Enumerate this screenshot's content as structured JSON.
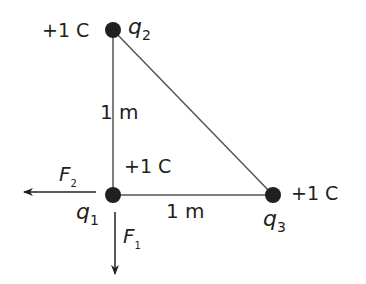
{
  "diagram": {
    "type": "point-charge-triangle",
    "charges": [
      {
        "id": "q1",
        "symbol": "q",
        "subscript": "1",
        "charge_label": "+1 C",
        "x": 113,
        "y": 195
      },
      {
        "id": "q2",
        "symbol": "q",
        "subscript": "2",
        "charge_label": "+1 C",
        "x": 113,
        "y": 30
      },
      {
        "id": "q3",
        "symbol": "q",
        "subscript": "3",
        "charge_label": "+1 C",
        "x": 273,
        "y": 195
      }
    ],
    "edges": [
      {
        "from": "q1",
        "to": "q2",
        "label": "1 m"
      },
      {
        "from": "q1",
        "to": "q3",
        "label": "1 m"
      },
      {
        "from": "q2",
        "to": "q3",
        "label": ""
      }
    ],
    "forces": [
      {
        "symbol": "F",
        "subscript": "2",
        "on": "q1",
        "direction": "left"
      },
      {
        "symbol": "F",
        "subscript": "1",
        "on": "q1",
        "direction": "down"
      }
    ],
    "colors": {
      "line": "#555555",
      "dot": "#231f20",
      "text": "#231f20"
    }
  }
}
